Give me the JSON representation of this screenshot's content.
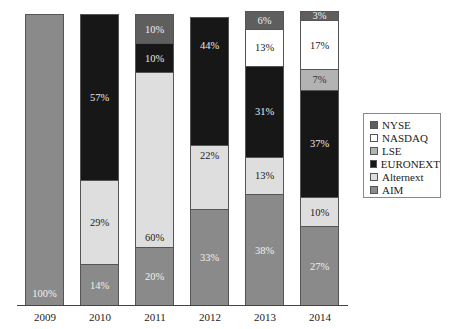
{
  "chart_data": {
    "type": "bar",
    "stacked": true,
    "percent": true,
    "title": "",
    "xlabel": "",
    "ylabel": "",
    "ylim": [
      0,
      100
    ],
    "grid": false,
    "legend_position": "right",
    "categories": [
      "2009",
      "2010",
      "2011",
      "2012",
      "2013",
      "2014"
    ],
    "series": [
      {
        "name": "AIM",
        "color": "#8a8a8a",
        "label_color": "#f0f0f0",
        "values": [
          100,
          14,
          20,
          33,
          38,
          27
        ]
      },
      {
        "name": "Alternext",
        "color": "#dedede",
        "label_color": "#222222",
        "values": [
          0,
          29,
          60,
          22,
          13,
          10
        ]
      },
      {
        "name": "EURONEXT",
        "color": "#171717",
        "label_color": "#e8e8e8",
        "values": [
          0,
          57,
          10,
          44,
          31,
          37
        ]
      },
      {
        "name": "LSE",
        "color": "#b3b3b3",
        "label_color": "#333333",
        "values": [
          0,
          0,
          0,
          0,
          0,
          7
        ]
      },
      {
        "name": "NASDAQ",
        "color": "#ffffff",
        "label_color": "#222222",
        "values": [
          0,
          0,
          0,
          0,
          13,
          17
        ]
      },
      {
        "name": "NYSE",
        "color": "#5e5e5e",
        "label_color": "#eeeeee",
        "values": [
          0,
          0,
          10,
          0,
          6,
          3
        ]
      }
    ],
    "data_labels": {
      "2009": [
        "100%"
      ],
      "2010": [
        "14%",
        "29%",
        "57%"
      ],
      "2011": [
        "20%",
        "60%",
        "10%",
        "10%"
      ],
      "2012": [
        "33%",
        "22%",
        "44%"
      ],
      "2013": [
        "38%",
        "13%",
        "31%",
        "13%",
        "6%"
      ],
      "2014": [
        "27%",
        "10%",
        "37%",
        "7%",
        "17%",
        "3%"
      ]
    }
  },
  "legend": {
    "items": [
      {
        "label": "NYSE",
        "color": "#5e5e5e"
      },
      {
        "label": "NASDAQ",
        "color": "#ffffff"
      },
      {
        "label": "LSE",
        "color": "#b3b3b3"
      },
      {
        "label": "EURONEXT",
        "color": "#171717"
      },
      {
        "label": "Alternext",
        "color": "#dedede"
      },
      {
        "label": "AIM",
        "color": "#8a8a8a"
      }
    ]
  },
  "layout": {
    "bar_lefts": [
      25,
      80,
      135,
      190,
      245,
      300
    ],
    "baseline_y": 305,
    "plot_height": 291
  }
}
